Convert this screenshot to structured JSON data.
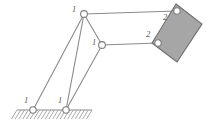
{
  "figure": {
    "type": "mechanism-linkage-diagram",
    "background_color": "#ffffff",
    "line_color": "#8a8a8a",
    "block_fill_color": "#a6a6a6",
    "block_stroke_color": "#6e6e6e",
    "ground_hatch_color": "#9a9a9a"
  },
  "labels": {
    "ground_left": "1",
    "ground_right": "1",
    "top_joint": "1",
    "middle_joint": "1",
    "block_top": "2",
    "block_bottom": "2"
  },
  "geometry": {
    "joints": [
      {
        "name": "ground-pivot-left",
        "label": "1",
        "x": 33,
        "y": 110,
        "r": 3.2
      },
      {
        "name": "ground-pivot-right",
        "label": "1",
        "x": 66,
        "y": 110,
        "r": 3.2
      },
      {
        "name": "top-joint",
        "label": "1",
        "x": 84,
        "y": 14,
        "r": 3.4
      },
      {
        "name": "middle-joint",
        "label": "1",
        "x": 102,
        "y": 45,
        "r": 3.4
      },
      {
        "name": "block-top-joint",
        "label": "2",
        "x": 177,
        "y": 11,
        "r": 3.2
      },
      {
        "name": "block-bottom-joint",
        "label": "2",
        "x": 158,
        "y": 43,
        "r": 3.2
      }
    ],
    "links": [
      {
        "name": "link-left-crank",
        "from": [
          33,
          110
        ],
        "to": [
          84,
          14
        ]
      },
      {
        "name": "link-right-crank",
        "from": [
          66,
          110
        ],
        "to": [
          84,
          14
        ]
      },
      {
        "name": "link-coupler-lower",
        "from": [
          66,
          110
        ],
        "to": [
          102,
          45
        ]
      },
      {
        "name": "link-top-connector",
        "from": [
          84,
          14
        ],
        "to": [
          177,
          11
        ]
      },
      {
        "name": "link-mid-connector",
        "from": [
          102,
          45
        ],
        "to": [
          158,
          43
        ]
      },
      {
        "name": "link-vertical-riser",
        "from": [
          84,
          14
        ],
        "to": [
          102,
          45
        ]
      }
    ],
    "ground": {
      "name": "ground-surface",
      "x1": 17,
      "x2": 92,
      "y": 110,
      "hatch_count": 20,
      "hatch_depth": 9
    },
    "block": {
      "name": "slider-block",
      "corners": [
        [
          176,
          4
        ],
        [
          202,
          24
        ],
        [
          177,
          62
        ],
        [
          152,
          43
        ]
      ]
    }
  },
  "label_positions": [
    {
      "name": "label-ground-left",
      "text": "1",
      "x": 26,
      "y": 103
    },
    {
      "name": "label-ground-right",
      "text": "1",
      "x": 60,
      "y": 103
    },
    {
      "name": "label-top-joint",
      "text": "1",
      "x": 74,
      "y": 12
    },
    {
      "name": "label-middle-joint",
      "text": "1",
      "x": 94,
      "y": 45
    },
    {
      "name": "label-block-top",
      "text": "2",
      "x": 165,
      "y": 20
    },
    {
      "name": "label-block-bottom",
      "text": "2",
      "x": 148,
      "y": 37
    }
  ]
}
